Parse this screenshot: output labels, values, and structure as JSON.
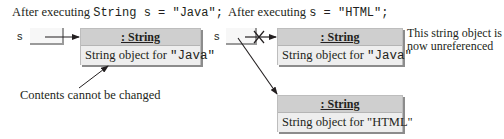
{
  "left_panel": {
    "caption_prefix": "After executing ",
    "caption_code": "String s = \"Java\";",
    "ref_var": "s",
    "object": {
      "class_label": ": String",
      "content_prefix": "String object for ",
      "content_value": "\"Java\""
    },
    "annotation": "Contents cannot be changed"
  },
  "right_panel": {
    "caption_prefix": "After executing ",
    "caption_code": "s = \"HTML\";",
    "ref_var": "s",
    "old_object": {
      "class_label": ": String",
      "content_prefix": "String object for ",
      "content_value": "\"Java\""
    },
    "note_line1": "This string object is",
    "note_line2": "now unreferenced",
    "new_object": {
      "class_label": ": String",
      "content_prefix": "String object for ",
      "content_value": "\"HTML\""
    }
  },
  "colors": {
    "object_header": "#cfcfcf",
    "object_body": "#eeeeee",
    "shadow": "#8c8c8c",
    "arrow": "#231f20"
  }
}
